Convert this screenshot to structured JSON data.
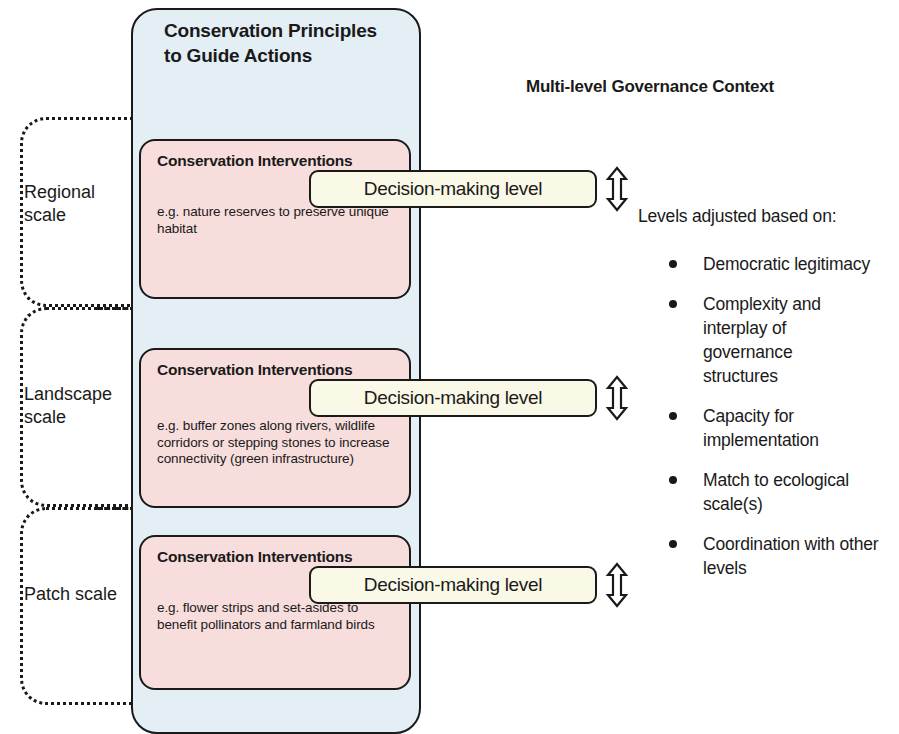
{
  "diagram": {
    "container_title": "Conservation Principles to Guide Actions",
    "governance_title": "Multi-level Governance Context",
    "decision_label": "Decision-making level",
    "intervention_title": "Conservation Interventions",
    "colors": {
      "container_fill": "#e4eef5",
      "intervention_fill": "#f7dedd",
      "decision_fill": "#faf8e6",
      "stroke": "#1a1a1a"
    },
    "scales": [
      {
        "label": "Regional scale",
        "intervention_title": "Conservation Interventions",
        "example": "e.g. nature reserves to preserve unique habitat",
        "decision_label": "Decision-making level"
      },
      {
        "label": "Landscape scale",
        "intervention_title": "Conservation Interventions",
        "example": "e.g. buffer zones along rivers, wildlife corridors or stepping stones to increase connectivity (green infrastructure)",
        "decision_label": "Decision-making level"
      },
      {
        "label": "Patch scale",
        "intervention_title": "Conservation Interventions",
        "example": "e.g. flower strips and set-asides to benefit pollinators and farmland birds",
        "decision_label": "Decision-making level"
      }
    ],
    "levels_intro": "Levels adjusted based on:",
    "levels_bullets": [
      "Democratic legitimacy",
      "Complexity and interplay of governance structures",
      "Capacity for implementation",
      "Match to ecological scale(s)",
      "Coordination with other levels"
    ]
  }
}
